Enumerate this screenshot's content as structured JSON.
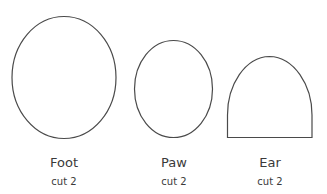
{
  "pieces": [
    {
      "name": "Foot",
      "count": "cut 2",
      "shape": "ellipse"
    },
    {
      "name": "Paw",
      "count": "cut 2",
      "shape": "ellipse"
    },
    {
      "name": "Ear",
      "count": "cut 2",
      "shape": "arch"
    }
  ],
  "colors": {
    "stroke": "#4a4a4a",
    "background": "#ffffff",
    "text": "#3a3a3a"
  }
}
